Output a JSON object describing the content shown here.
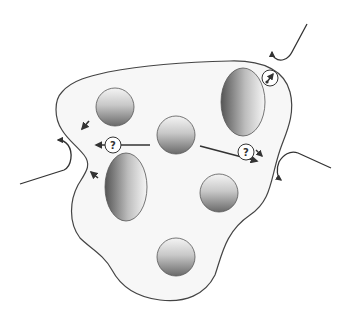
{
  "diagram": {
    "type": "cell-schematic",
    "colors": {
      "outline": "#444444",
      "cell_fill": "#f7f7f7",
      "organelle_dark": "#6e6e6e",
      "organelle_light": "#f2f2f2",
      "arrow": "#333333"
    },
    "question_labels": [
      {
        "id": "q-left",
        "text": "?"
      },
      {
        "id": "q-right",
        "text": "?"
      }
    ],
    "organelles": {
      "spheres": [
        {
          "id": "sphere-1",
          "cx": 115,
          "cy": 107,
          "r": 19
        },
        {
          "id": "sphere-2",
          "cx": 176,
          "cy": 135,
          "r": 19
        },
        {
          "id": "sphere-3",
          "cx": 219,
          "cy": 193,
          "r": 19
        },
        {
          "id": "sphere-4",
          "cx": 176,
          "cy": 257,
          "r": 19
        }
      ],
      "ellipses": [
        {
          "id": "ellipse-right",
          "cx": 243,
          "cy": 102,
          "rx": 22,
          "ry": 34
        },
        {
          "id": "ellipse-left",
          "cx": 126,
          "cy": 187,
          "rx": 21,
          "ry": 34
        }
      ]
    }
  }
}
